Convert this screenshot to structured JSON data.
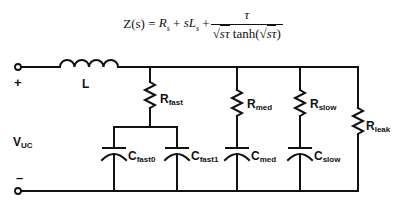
{
  "equation": {
    "lhs": "Z(s) =",
    "term1": "R",
    "term1_sub": "s",
    "plus1": "+",
    "term2": "sL",
    "term2_sub": "s",
    "plus2": "+",
    "numerator": "τ",
    "den_sqrt1": "sτ",
    "den_func": "tanh(",
    "den_sqrt2": "sτ",
    "den_close": ")",
    "radical": "√"
  },
  "circuit": {
    "terminal_plus": "+",
    "terminal_minus": "–",
    "voltage_label": "V",
    "voltage_sub": "UC",
    "inductor_label": "L",
    "resistors": [
      {
        "name": "R",
        "sub": "fast"
      },
      {
        "name": "R",
        "sub": "med"
      },
      {
        "name": "R",
        "sub": "slow"
      },
      {
        "name": "R",
        "sub": "leak"
      }
    ],
    "capacitors": [
      {
        "name": "C",
        "sub": "fast0"
      },
      {
        "name": "C",
        "sub": "fast1"
      },
      {
        "name": "C",
        "sub": "med"
      },
      {
        "name": "C",
        "sub": "slow"
      }
    ],
    "wire_color": "#111111"
  }
}
